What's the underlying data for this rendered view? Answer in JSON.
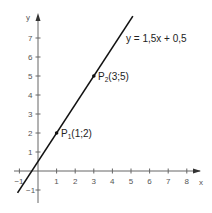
{
  "chart_data": {
    "type": "line",
    "title": "",
    "xlabel": "x",
    "ylabel": "y",
    "xlim": [
      -1.2,
      8.7
    ],
    "ylim": [
      -1.5,
      8
    ],
    "grid": false,
    "x_ticks": [
      -1,
      1,
      2,
      3,
      4,
      5,
      6,
      7,
      8
    ],
    "x_tick_labels": [
      "−1",
      "1",
      "2",
      "3",
      "4",
      "5",
      "6",
      "7",
      "8"
    ],
    "y_ticks": [
      -1,
      1,
      2,
      3,
      4,
      5,
      6,
      7
    ],
    "y_tick_labels": [
      "−1",
      "1",
      "2",
      "3",
      "4",
      "5",
      "6",
      "7"
    ],
    "series": [
      {
        "name": "y = 1,5x + 0,5",
        "equation": {
          "slope": 1.5,
          "intercept": 0.5
        },
        "x": [
          -1.1,
          5.1
        ],
        "y": [
          -1.15,
          8.15
        ],
        "color": "#111111"
      }
    ],
    "points": [
      {
        "name": "P",
        "sub": "1",
        "coords": "(1;2)",
        "x": 1,
        "y": 2
      },
      {
        "name": "P",
        "sub": "2",
        "coords": "(3;5)",
        "x": 3,
        "y": 5
      }
    ],
    "annotations": [
      {
        "text": "y = 1,5x + 0,5",
        "near": "line upper end"
      }
    ]
  },
  "labels": {
    "equation": "y = 1,5x + 0,5",
    "p1_name": "P",
    "p1_sub": "1",
    "p1_coords": "(1;2)",
    "p2_name": "P",
    "p2_sub": "2",
    "p2_coords": "(3;5)",
    "x_axis": "x",
    "y_axis": "y"
  }
}
